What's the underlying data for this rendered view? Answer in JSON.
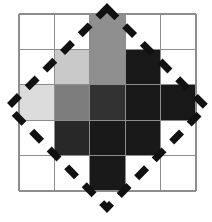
{
  "figure": {
    "canvas": {
      "width": 212,
      "height": 222,
      "background": "#ffffff"
    },
    "grid": {
      "rows": 5,
      "cols": 5,
      "origin_x": 19,
      "origin_y": 14,
      "cell_size": 35.4,
      "line_color": "#8d8d8d",
      "line_width": 1.3,
      "empty_color": "#ffffff"
    },
    "palette": {
      "empty": "#ffffff",
      "lightest": "#dcdcdc",
      "light": "#c9c9c9",
      "medium": "#8f8f8f",
      "medium_dark": "#7d7d7d",
      "dark": "#323232",
      "darker": "#282828",
      "darkest": "#191919"
    },
    "cells": [
      [
        {
          "row": 0,
          "col": 0,
          "fill": "#ffffff",
          "shade": "empty"
        },
        {
          "row": 0,
          "col": 1,
          "fill": "#ffffff",
          "shade": "empty"
        },
        {
          "row": 0,
          "col": 2,
          "fill": "#8f8f8f",
          "shade": "medium"
        },
        {
          "row": 0,
          "col": 3,
          "fill": "#ffffff",
          "shade": "empty"
        },
        {
          "row": 0,
          "col": 4,
          "fill": "#ffffff",
          "shade": "empty"
        }
      ],
      [
        {
          "row": 1,
          "col": 0,
          "fill": "#ffffff",
          "shade": "empty"
        },
        {
          "row": 1,
          "col": 1,
          "fill": "#c9c9c9",
          "shade": "light"
        },
        {
          "row": 1,
          "col": 2,
          "fill": "#8f8f8f",
          "shade": "medium"
        },
        {
          "row": 1,
          "col": 3,
          "fill": "#191919",
          "shade": "darkest"
        },
        {
          "row": 1,
          "col": 4,
          "fill": "#ffffff",
          "shade": "empty"
        }
      ],
      [
        {
          "row": 2,
          "col": 0,
          "fill": "#dcdcdc",
          "shade": "lightest"
        },
        {
          "row": 2,
          "col": 1,
          "fill": "#7d7d7d",
          "shade": "medium_dark"
        },
        {
          "row": 2,
          "col": 2,
          "fill": "#323232",
          "shade": "dark"
        },
        {
          "row": 2,
          "col": 3,
          "fill": "#191919",
          "shade": "darkest"
        },
        {
          "row": 2,
          "col": 4,
          "fill": "#191919",
          "shade": "darkest"
        }
      ],
      [
        {
          "row": 3,
          "col": 0,
          "fill": "#ffffff",
          "shade": "empty"
        },
        {
          "row": 3,
          "col": 1,
          "fill": "#282828",
          "shade": "darker"
        },
        {
          "row": 3,
          "col": 2,
          "fill": "#191919",
          "shade": "darkest"
        },
        {
          "row": 3,
          "col": 3,
          "fill": "#191919",
          "shade": "darkest"
        },
        {
          "row": 3,
          "col": 4,
          "fill": "#ffffff",
          "shade": "empty"
        }
      ],
      [
        {
          "row": 4,
          "col": 0,
          "fill": "#ffffff",
          "shade": "empty"
        },
        {
          "row": 4,
          "col": 1,
          "fill": "#ffffff",
          "shade": "empty"
        },
        {
          "row": 4,
          "col": 2,
          "fill": "#191919",
          "shade": "darkest"
        },
        {
          "row": 4,
          "col": 3,
          "fill": "#ffffff",
          "shade": "empty"
        },
        {
          "row": 4,
          "col": 4,
          "fill": "#ffffff",
          "shade": "empty"
        }
      ]
    ],
    "overlay": {
      "shape": "diamond",
      "stroke_color": "#111111",
      "stroke_width": 7,
      "dash_pattern": "14 11",
      "vertices": [
        {
          "name": "top",
          "x": 107,
          "y": 8
        },
        {
          "name": "right",
          "x": 206,
          "y": 107
        },
        {
          "name": "bottom",
          "x": 107,
          "y": 208
        },
        {
          "name": "left",
          "x": 8,
          "y": 107
        }
      ]
    }
  }
}
